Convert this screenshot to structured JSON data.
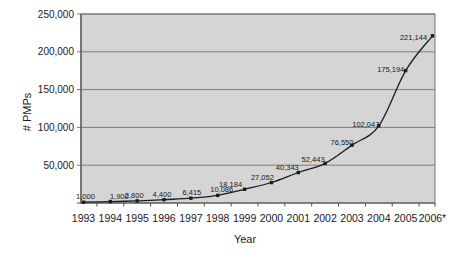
{
  "chart_data": {
    "type": "line",
    "title": "",
    "xlabel": "Year",
    "ylabel": "# PMPs",
    "categories": [
      "1993",
      "1994",
      "1995",
      "1996",
      "1997",
      "1998",
      "1999",
      "2000",
      "2001",
      "2002",
      "2003",
      "2004",
      "2005",
      "2006*"
    ],
    "values": [
      1000,
      1900,
      2800,
      4400,
      6415,
      10086,
      18184,
      27052,
      40343,
      52443,
      76550,
      102047,
      175194,
      221144
    ],
    "data_labels": [
      "1,000",
      "1,900",
      "2,800",
      "4,400",
      "6,415",
      "10,086",
      "18,184",
      "27,052",
      "40,343",
      "52,443",
      "76,550",
      "102,047",
      "175,194",
      "221,144"
    ],
    "ylim": [
      0,
      250000
    ],
    "y_tick_step": 50000,
    "y_tick_labels": [
      "50,000",
      "100,000",
      "150,000",
      "200,000",
      "250,000"
    ],
    "grid": "horizontal",
    "legend": "none",
    "marker": "square",
    "smooth_line": true,
    "colors": {
      "background": "#ffffff",
      "plot_fill": "#d5d5d5",
      "gridline": "#7d7d7d",
      "plot_border": "#757575",
      "axis": "#4f4f4f",
      "line": "#1c1c1c",
      "text": "#1a1a1a"
    }
  }
}
